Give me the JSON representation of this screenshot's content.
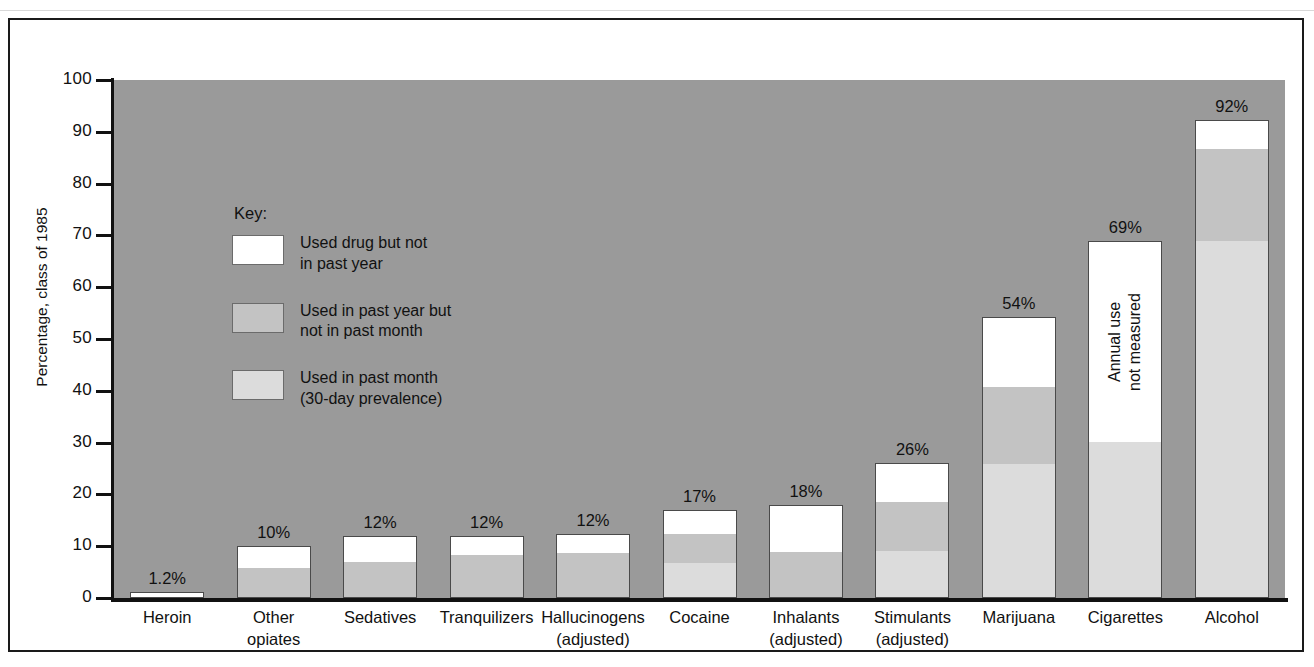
{
  "chart_data": {
    "type": "bar",
    "title": "",
    "xlabel": "",
    "ylabel": "Percentage, class of 1985",
    "ylim": [
      0,
      100
    ],
    "ytick_values": [
      100,
      90,
      80,
      70,
      60,
      50,
      40,
      30,
      20,
      10,
      0
    ],
    "ytick_labels": [
      "100",
      "90",
      "80",
      "70",
      "60",
      "50",
      "40",
      "30",
      "20",
      "10",
      "0"
    ],
    "grid": false,
    "stacked": true,
    "legend_position": "inside-upper-left",
    "series": [
      {
        "name": "Used in past month (30-day prevalence)",
        "key": "past_month",
        "color": "#dcdcdc"
      },
      {
        "name": "Used in past year but not in past month",
        "key": "past_year_not_month",
        "color": "#c3c3c3"
      },
      {
        "name": "Used drug but not in past year",
        "key": "not_past_year",
        "color": "#ffffff"
      }
    ],
    "categories": [
      "Heroin",
      "Other opiates",
      "Sedatives",
      "Tranquilizers",
      "Hallucinogens (adjusted)",
      "Cocaine",
      "Inhalants (adjusted)",
      "Stimulants (adjusted)",
      "Marijuana",
      "Cigarettes",
      "Alcohol"
    ],
    "bars": [
      {
        "category": "Heroin",
        "label_line1": "Heroin",
        "label_line2": "",
        "total": 1.2,
        "total_label": "1.2%",
        "past_month": 0.0,
        "past_year_not_month": 0.0,
        "not_past_year": 1.2,
        "note": ""
      },
      {
        "category": "Other opiates",
        "label_line1": "Other",
        "label_line2": "opiates",
        "total": 10.0,
        "total_label": "10%",
        "past_month": 0.0,
        "past_year_not_month": 5.9,
        "not_past_year": 4.1,
        "note": ""
      },
      {
        "category": "Sedatives",
        "label_line1": "Sedatives",
        "label_line2": "",
        "total": 12.0,
        "total_label": "12%",
        "past_month": 0.0,
        "past_year_not_month": 7.0,
        "not_past_year": 5.0,
        "note": ""
      },
      {
        "category": "Tranquilizers",
        "label_line1": "Tranquilizers",
        "label_line2": "",
        "total": 12.0,
        "total_label": "12%",
        "past_month": 0.0,
        "past_year_not_month": 8.3,
        "not_past_year": 3.7,
        "note": ""
      },
      {
        "category": "Hallucinogens",
        "label_line1": "Hallucinogens",
        "label_line2": "(adjusted)",
        "total": 12.3,
        "total_label": "12%",
        "past_month": 0.0,
        "past_year_not_month": 8.8,
        "not_past_year": 3.5,
        "note": ""
      },
      {
        "category": "Cocaine",
        "label_line1": "Cocaine",
        "label_line2": "",
        "total": 17.0,
        "total_label": "17%",
        "past_month": 6.7,
        "past_year_not_month": 5.8,
        "not_past_year": 4.5,
        "note": ""
      },
      {
        "category": "Inhalants",
        "label_line1": "Inhalants",
        "label_line2": "(adjusted)",
        "total": 18.0,
        "total_label": "18%",
        "past_month": 0.0,
        "past_year_not_month": 8.9,
        "not_past_year": 9.1,
        "note": ""
      },
      {
        "category": "Stimulants",
        "label_line1": "Stimulants",
        "label_line2": "(adjusted)",
        "total": 26.0,
        "total_label": "26%",
        "past_month": 9.1,
        "past_year_not_month": 9.5,
        "not_past_year": 7.4,
        "note": ""
      },
      {
        "category": "Marijuana",
        "label_line1": "Marijuana",
        "label_line2": "",
        "total": 54.2,
        "total_label": "54%",
        "past_month": 25.9,
        "past_year_not_month": 14.9,
        "not_past_year": 13.4,
        "note": ""
      },
      {
        "category": "Cigarettes",
        "label_line1": "Cigarettes",
        "label_line2": "",
        "total": 69.0,
        "total_label": "69%",
        "past_month": 30.1,
        "past_year_not_month": 0.0,
        "not_past_year": 38.9,
        "note": "Annual use\nnot measured"
      },
      {
        "category": "Alcohol",
        "label_line1": "Alcohol",
        "label_line2": "",
        "total": 92.2,
        "total_label": "92%",
        "past_month": 69.0,
        "past_year_not_month": 17.8,
        "not_past_year": 5.4,
        "note": ""
      }
    ]
  },
  "legend": {
    "title": "Key:",
    "items": [
      {
        "swatch": "#ffffff",
        "line1": "Used drug but not",
        "line2": "in past year"
      },
      {
        "swatch": "#c3c3c3",
        "line1": "Used in past year but",
        "line2": "not in past month"
      },
      {
        "swatch": "#dcdcdc",
        "line1": "Used in past month",
        "line2": "(30-day prevalence)"
      }
    ]
  },
  "colors": {
    "plot_background": "#9a9a9a",
    "page_background": "#ffffff",
    "frame": "#1a1a1a",
    "axis": "#111111",
    "segment_not_past_year": "#ffffff",
    "segment_past_year_not_month": "#c3c3c3",
    "segment_past_month": "#dcdcdc"
  }
}
